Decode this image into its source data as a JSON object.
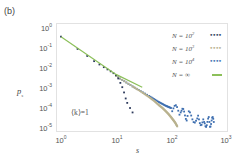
{
  "panel_label": "(b)",
  "annotation": "⟨k⟩=1",
  "colors": {
    "n100": "#2d3a5c",
    "n1000": "#b9b28f",
    "n10000": "#3e6fb0",
    "ninf": "#8cc05a",
    "frame": "#e2e2e2"
  },
  "axes": {
    "xlabel": "s",
    "ylabel": "p_s",
    "x_ticks": [
      {
        "base": "10",
        "exp": "0"
      },
      {
        "base": "10",
        "exp": "1"
      },
      {
        "base": "10",
        "exp": "2"
      },
      {
        "base": "10",
        "exp": "3"
      }
    ],
    "y_ticks": [
      {
        "base": "10",
        "exp": "0"
      },
      {
        "base": "10",
        "exp": "-1"
      },
      {
        "base": "10",
        "exp": "-2"
      },
      {
        "base": "10",
        "exp": "-3"
      },
      {
        "base": "10",
        "exp": "-4"
      },
      {
        "base": "10",
        "exp": "-5"
      }
    ]
  },
  "legend": [
    {
      "label_prefix": "N = 10",
      "label_exp": "2",
      "marker": "dots",
      "marker_text": "••••"
    },
    {
      "label_prefix": "N = 10",
      "label_exp": "3",
      "marker": "dots",
      "marker_text": "••••"
    },
    {
      "label_prefix": "N = 10",
      "label_exp": "4",
      "marker": "dots",
      "marker_text": "••••"
    },
    {
      "label_prefix": "N = ∞",
      "label_exp": "",
      "marker": "line",
      "marker_text": ""
    }
  ],
  "chart_data": {
    "type": "scatter",
    "title": "",
    "xlabel": "s",
    "ylabel": "p_s",
    "xscale": "log",
    "yscale": "log",
    "xlim": [
      1,
      1000
    ],
    "ylim": [
      1e-05,
      1
    ],
    "grid": false,
    "legend_position": "upper right",
    "annotations": [
      "(b)",
      "⟨k⟩=1"
    ],
    "series": [
      {
        "name": "N=10^2",
        "style": "dots",
        "color": "#2d3a5c",
        "x": [
          1,
          2,
          3,
          4,
          5,
          6,
          7,
          8,
          9,
          10,
          11,
          12,
          13,
          14,
          15,
          16,
          18,
          20
        ],
        "y": [
          0.37,
          0.09,
          0.04,
          0.022,
          0.015,
          0.011,
          0.0085,
          0.0068,
          0.0055,
          0.0044,
          0.003,
          0.0018,
          0.0011,
          0.0006,
          0.0003,
          0.00018,
          0.0001,
          6e-05
        ]
      },
      {
        "name": "N=10^3",
        "style": "dots",
        "color": "#b9b28f",
        "x": [
          10,
          20,
          30,
          40,
          50,
          60,
          70,
          80,
          90,
          100,
          110,
          120,
          130
        ],
        "y": [
          0.004,
          0.0012,
          0.0006,
          0.00035,
          0.00022,
          0.00014,
          0.0001,
          7e-05,
          5e-05,
          3.5e-05,
          2.5e-05,
          1.8e-05,
          1.2e-05
        ]
      },
      {
        "name": "N=10^4",
        "style": "dots",
        "color": "#3e6fb0",
        "x": [
          10,
          20,
          40,
          60,
          80,
          100,
          150,
          200,
          300,
          400,
          500,
          600
        ],
        "y": [
          0.004,
          0.0012,
          0.0004,
          0.0002,
          0.00013,
          0.0001,
          6e-05,
          4e-05,
          3e-05,
          2e-05,
          2e-05,
          2e-05
        ]
      },
      {
        "name": "N=∞",
        "style": "line",
        "color": "#8cc05a",
        "x": [
          1,
          10,
          30
        ],
        "y": [
          0.37,
          0.0048,
          0.0011
        ]
      }
    ]
  }
}
